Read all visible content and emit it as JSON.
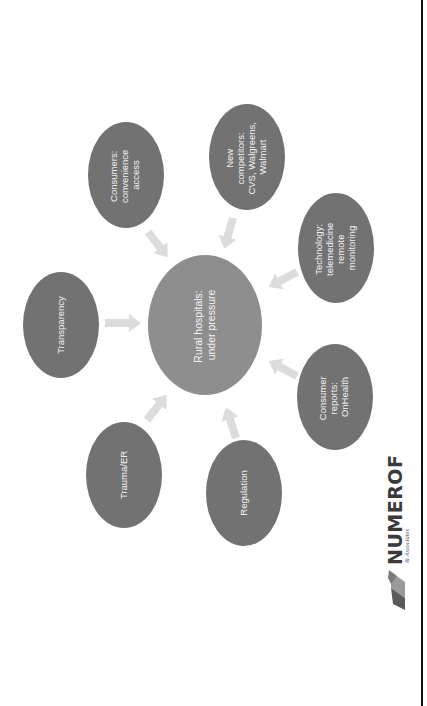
{
  "diagram": {
    "type": "hub-and-spoke",
    "orientation": "rotated -90deg (page rendered sideways)",
    "center": {
      "id": "rural-hospitals",
      "lines": [
        "Rural hospitals:",
        "under pressure"
      ]
    },
    "nodes": [
      {
        "id": "consumers",
        "lines": [
          "Consumers:",
          "convenience",
          "access"
        ]
      },
      {
        "id": "new-competitors",
        "lines": [
          "New",
          "competitors:",
          "CVS, Walgreens,",
          "Walmart"
        ]
      },
      {
        "id": "technology",
        "lines": [
          "Technology:",
          "telemedicine",
          "remote",
          "monitoring"
        ]
      },
      {
        "id": "consumer-reports",
        "lines": [
          "Consumer",
          "reports:",
          "OnHealth"
        ]
      },
      {
        "id": "regulation",
        "lines": [
          "Regulation"
        ]
      },
      {
        "id": "trauma-er",
        "lines": [
          "Trauma/ER"
        ]
      },
      {
        "id": "transparency",
        "lines": [
          "Transparency"
        ]
      }
    ],
    "edges": [
      {
        "from": "consumers",
        "to": "rural-hospitals"
      },
      {
        "from": "new-competitors",
        "to": "rural-hospitals"
      },
      {
        "from": "technology",
        "to": "rural-hospitals"
      },
      {
        "from": "consumer-reports",
        "to": "rural-hospitals"
      },
      {
        "from": "regulation",
        "to": "rural-hospitals"
      },
      {
        "from": "trauma-er",
        "to": "rural-hospitals"
      },
      {
        "from": "transparency",
        "to": "rural-hospitals"
      }
    ]
  },
  "logo": {
    "name": "NUMEROF",
    "tagline": "& Associates"
  },
  "colors": {
    "node_fill": "#6e6e6e",
    "center_fill": "#8c8c8c",
    "arrow_fill": "#dcdcdc",
    "text": "#f2f2f2",
    "rule": "#111111"
  }
}
